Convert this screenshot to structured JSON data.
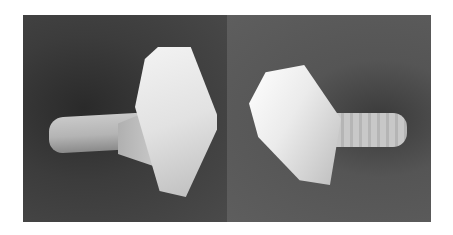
{
  "image": {
    "description": "Two photographs side by side of a white plastic thumb screw / knob-headed bolt on a gray background",
    "panels": [
      {
        "position": "left",
        "subject": "thumb screw viewed from the left, with a diamond-shaped head facing the right"
      },
      {
        "position": "right",
        "subject": "thumb screw viewed from the right, with a rounded wedge head and a threaded shaft extending to the right"
      }
    ],
    "colors": {
      "background": "#ffffff",
      "left_panel": "#3c3c3c",
      "right_panel": "#5a5a5a",
      "object": "#e6e6e6"
    }
  }
}
